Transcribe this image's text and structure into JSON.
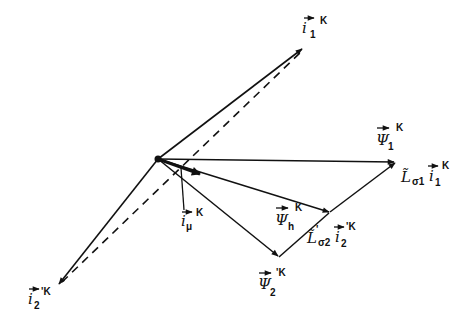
{
  "diagram": {
    "type": "phasor-diagram",
    "origin": {
      "x": 158,
      "y": 159
    },
    "vectors": [
      {
        "id": "i1",
        "symbol": "i",
        "subscript": "1",
        "prime": "",
        "superscript": "K",
        "from": [
          158,
          159
        ],
        "to": [
          303,
          48
        ],
        "style": "solid"
      },
      {
        "id": "psi1",
        "symbol": "Ψ",
        "subscript": "1",
        "prime": "",
        "superscript": "K",
        "from": [
          158,
          159
        ],
        "to": [
          396,
          162
        ],
        "style": "solid"
      },
      {
        "id": "psih",
        "symbol": "Ψ",
        "subscript": "h",
        "prime": "",
        "superscript": "K",
        "from": [
          158,
          159
        ],
        "to": [
          330,
          212
        ],
        "style": "solid"
      },
      {
        "id": "psi2",
        "symbol": "Ψ",
        "subscript": "2",
        "prime": "'",
        "superscript": "K",
        "from": [
          158,
          159
        ],
        "to": [
          279,
          257
        ],
        "style": "solid"
      },
      {
        "id": "i2",
        "symbol": "i",
        "subscript": "2",
        "prime": "'",
        "superscript": "K",
        "from": [
          158,
          159
        ],
        "to": [
          58,
          285
        ],
        "style": "solid"
      },
      {
        "id": "imu",
        "symbol": "i",
        "subscript": "μ",
        "prime": "",
        "superscript": "K",
        "from": [
          158,
          159
        ],
        "to": [
          201,
          174
        ],
        "style": "bold"
      },
      {
        "id": "Ls1i1",
        "symbol": "L̃σ1 i1",
        "from": [
          330,
          212
        ],
        "to": [
          396,
          162
        ],
        "style": "solid"
      },
      {
        "id": "Ls2i2",
        "symbol": "L̃'σ2 i'2",
        "from": [
          279,
          257
        ],
        "to": [
          330,
          212
        ],
        "style": "solid"
      }
    ],
    "dashed_line": {
      "from": [
        62,
        282
      ],
      "to": [
        303,
        50
      ]
    },
    "labels": {
      "i1": {
        "main": "i",
        "sub": "1",
        "sup": "K"
      },
      "psi1": {
        "main": "Ψ",
        "sub": "1",
        "sup": "K"
      },
      "Ls1i1": {
        "main": "L̃",
        "sub": "σ1",
        "main2": "i",
        "sub2": "1",
        "sup": "K"
      },
      "psih": {
        "main": "Ψ",
        "sub": "h",
        "sup": "K"
      },
      "imu": {
        "main": "i",
        "sub": "μ",
        "sup": "K"
      },
      "Ls2i2": {
        "main": "L̃",
        "sub": "σ2",
        "prime": "'",
        "main2": "i",
        "sub2": "2",
        "sup": "'K"
      },
      "psi2": {
        "main": "Ψ",
        "sub": "2",
        "sup": "'K"
      },
      "i2": {
        "main": "i",
        "sub": "2",
        "sup": "'K"
      }
    },
    "colors": {
      "ink": "#111111",
      "background": "#ffffff"
    }
  }
}
